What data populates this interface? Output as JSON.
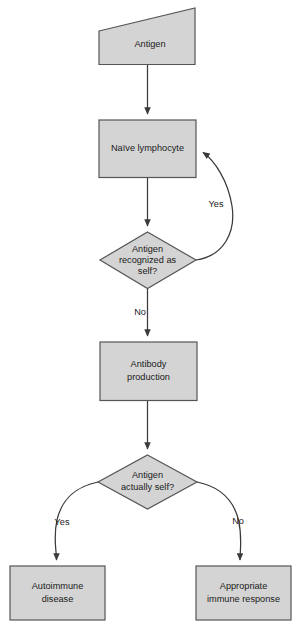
{
  "diagram": {
    "colors": {
      "node_fill": "#d4d4d4",
      "node_stroke": "#555555",
      "connector": "#3a3a3a",
      "background": "#ffffff",
      "text": "#1a1a1a"
    },
    "nodes": {
      "antigen": {
        "shape": "slanted-quadrilateral",
        "label": "Antigen",
        "lines": [
          "Antigen"
        ]
      },
      "naive_lymphocyte": {
        "shape": "rectangle",
        "label": "Naïve lymphocyte",
        "lines": [
          "Naïve lymphocyte"
        ]
      },
      "decision_recognized_self": {
        "shape": "diamond",
        "label": "Antigen recognized as self?",
        "lines": [
          "Antigen",
          "recognized as",
          "self?"
        ]
      },
      "antibody_production": {
        "shape": "rectangle",
        "label": "Antibody production",
        "lines": [
          "Antibody",
          "production"
        ]
      },
      "decision_actually_self": {
        "shape": "diamond",
        "label": "Antigen actually self?",
        "lines": [
          "Antigen",
          "actually self?"
        ]
      },
      "autoimmune_disease": {
        "shape": "rectangle",
        "label": "Autoimmune disease",
        "lines": [
          "Autoimmune",
          "disease"
        ]
      },
      "appropriate_immune_response": {
        "shape": "rectangle",
        "label": "Appropriate immune response",
        "lines": [
          "Appropriate",
          "immune response"
        ]
      }
    },
    "edges": {
      "antigen_to_lymphocyte": {
        "label": ""
      },
      "lymphocyte_to_decision1": {
        "label": ""
      },
      "decision1_yes_loop": {
        "label": "Yes"
      },
      "decision1_no": {
        "label": "No"
      },
      "antibody_to_decision2": {
        "label": ""
      },
      "decision2_yes": {
        "label": "Yes"
      },
      "decision2_no": {
        "label": "No"
      }
    }
  }
}
